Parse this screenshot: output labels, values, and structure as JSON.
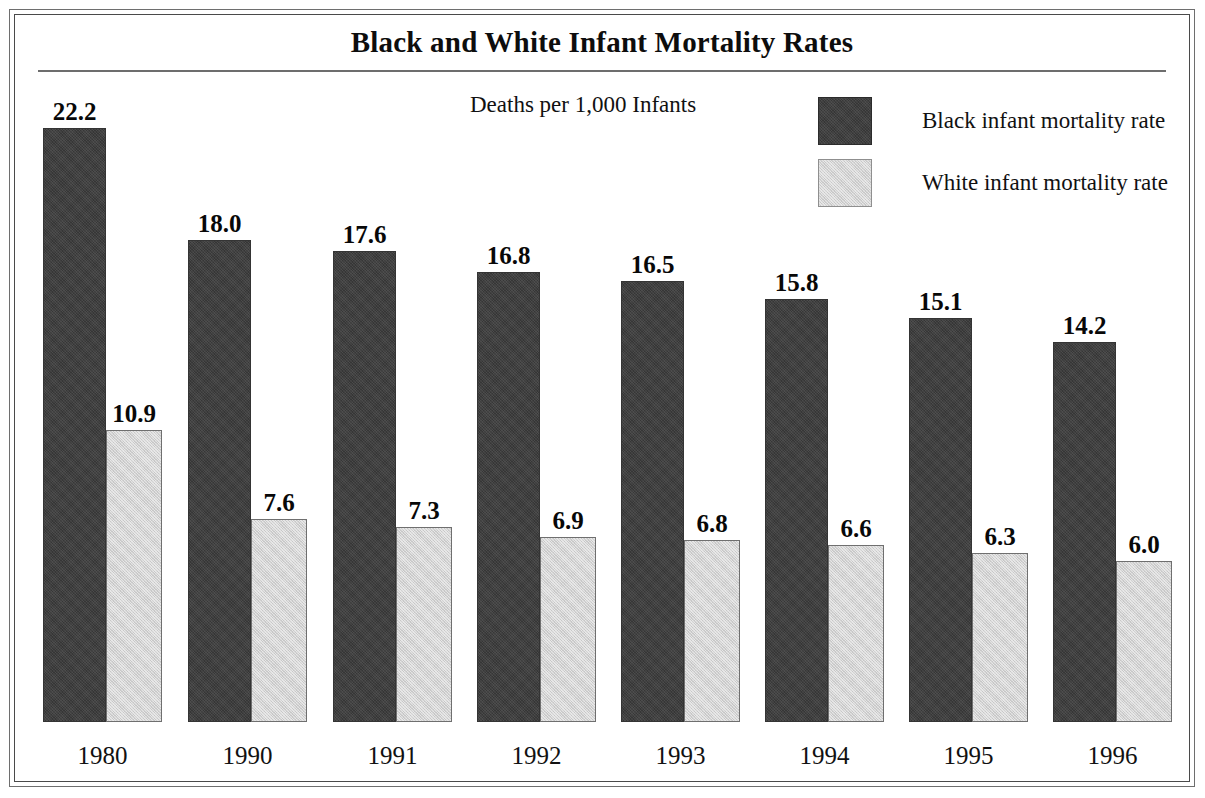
{
  "chart_data": {
    "type": "bar",
    "title": "Black and White Infant Mortality Rates",
    "subtitle": "Deaths per 1,000 Infants",
    "xlabel": "",
    "ylabel": "Deaths per 1,000 Infants",
    "ylim": [
      0,
      22.2
    ],
    "grid": false,
    "legend_position": "top-right",
    "categories": [
      "1980",
      "1990",
      "1991",
      "1992",
      "1993",
      "1994",
      "1995",
      "1996"
    ],
    "series": [
      {
        "name": "Black infant mortality rate",
        "color": "#3f3f3f",
        "values": [
          22.2,
          18.0,
          17.6,
          16.8,
          16.5,
          15.8,
          15.1,
          14.2
        ],
        "labels": [
          "22.2",
          "18.0",
          "17.6",
          "16.8",
          "16.5",
          "15.8",
          "15.1",
          "14.2"
        ]
      },
      {
        "name": "White infant mortality rate",
        "color": "#d2d2d2",
        "values": [
          10.9,
          7.6,
          7.3,
          6.9,
          6.8,
          6.6,
          6.3,
          6.0
        ],
        "labels": [
          "10.9",
          "7.6",
          "7.3",
          "6.9",
          "6.8",
          "6.6",
          "6.3",
          "6.0"
        ]
      }
    ]
  },
  "legend": {
    "items": [
      {
        "label": "Black infant mortality rate",
        "swatch": "black"
      },
      {
        "label": "White infant mortality rate",
        "swatch": "white"
      }
    ]
  },
  "colors": {
    "black_bar": "#3f3f3f",
    "white_bar": "#d2d2d2",
    "text": "#111111",
    "frame": "#4a4a4a",
    "rule": "#6d6d6d"
  }
}
